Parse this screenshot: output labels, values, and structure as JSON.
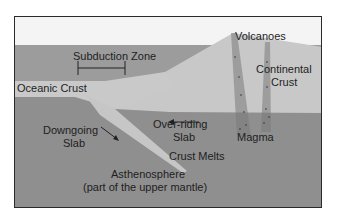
{
  "diagram": {
    "colors": {
      "sky": "#f4f4f4",
      "ocean": "#9a9a9a",
      "crust": "#c9c9c9",
      "mantle": "#8f8f8f",
      "text": "#1e1e1e"
    },
    "labels": {
      "subduction_zone": "Subduction Zone",
      "oceanic_crust": "Oceanic Crust",
      "volcanoes": "Volcanoes",
      "continental_crust_1": "Continental",
      "continental_crust_2": "Crust",
      "downgoing_slab_1": "Downgoing",
      "downgoing_slab_2": "Slab",
      "overriding_slab_1": "Over-riding",
      "overriding_slab_2": "Slab",
      "magma": "Magma",
      "crust_melts": "Crust Melts",
      "asthenosphere_1": "Asthenosphere",
      "asthenosphere_2": "(part of the upper mantle)"
    },
    "arrows": [
      {
        "name": "downgoing-slab-arrow",
        "direction": "down-right"
      },
      {
        "name": "overriding-slab-arrow",
        "direction": "left"
      }
    ]
  }
}
